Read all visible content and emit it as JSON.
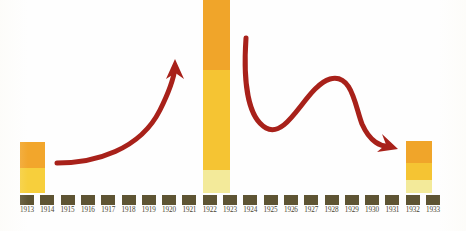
{
  "chart_data": {
    "type": "bar",
    "title": "",
    "subtitle": "",
    "xlabel": "",
    "ylabel": "",
    "grid": false,
    "legend_position": "none",
    "categories": [
      "1913",
      "1914",
      "1915",
      "1916",
      "1917",
      "1918",
      "1919",
      "1920",
      "1921",
      "1922",
      "1923",
      "1924",
      "1925",
      "1926",
      "1927",
      "1928",
      "1929",
      "1930",
      "1931",
      "1932",
      "1933"
    ],
    "annotations": [
      {
        "name": "rising-trend-arrow",
        "shape": "curved-arrow-up-right",
        "color": "#a8211a",
        "from_category": "1914",
        "to_category": "1921",
        "meaning": "sharp rise toward 1922 peak"
      },
      {
        "name": "falling-trend-arrow",
        "shape": "wavy-arrow-down-right",
        "color": "#a8211a",
        "from_category": "1923",
        "to_category": "1931",
        "meaning": "volatile decline toward 1932"
      }
    ],
    "series": [
      {
        "name": "top-segment",
        "color": "#f0a52a",
        "values": [
          26,
          0,
          0,
          0,
          0,
          0,
          0,
          0,
          0,
          70,
          0,
          0,
          0,
          0,
          0,
          0,
          0,
          0,
          0,
          22,
          0
        ]
      },
      {
        "name": "middle-segment",
        "color": "#f5c433",
        "values": [
          0,
          0,
          0,
          0,
          0,
          0,
          0,
          0,
          0,
          100,
          0,
          0,
          0,
          0,
          0,
          0,
          0,
          0,
          0,
          17,
          0
        ]
      },
      {
        "name": "bottom-segment",
        "color": "#f7d23f",
        "values": [
          25,
          0,
          0,
          0,
          0,
          0,
          0,
          0,
          0,
          0,
          0,
          0,
          0,
          0,
          0,
          0,
          0,
          0,
          0,
          0,
          0
        ]
      },
      {
        "name": "base-segment",
        "color": "#f3ea9a",
        "values": [
          0,
          0,
          0,
          0,
          0,
          0,
          0,
          0,
          0,
          23,
          0,
          0,
          0,
          0,
          0,
          0,
          0,
          0,
          0,
          13,
          0
        ]
      }
    ],
    "bars": [
      {
        "category": "1913",
        "x": 20,
        "width": 25,
        "top": 142,
        "bottom": 193,
        "clipped_top": false,
        "segments": [
          {
            "name": "orange-top",
            "color": "#f2a62c",
            "top": 142,
            "bottom": 168
          },
          {
            "name": "yellow-bottom",
            "color": "#f7cf3c",
            "top": 168,
            "bottom": 193
          }
        ]
      },
      {
        "category": "1922",
        "x": 203,
        "width": 27,
        "top": 0,
        "bottom": 193,
        "clipped_top": true,
        "segments": [
          {
            "name": "orange-top",
            "color": "#f0a52a",
            "top": 0,
            "bottom": 70
          },
          {
            "name": "amber-middle",
            "color": "#f5c433",
            "top": 70,
            "bottom": 170
          },
          {
            "name": "pale-yellow-base",
            "color": "#f3ea9a",
            "top": 170,
            "bottom": 193
          }
        ]
      },
      {
        "category": "1932",
        "x": 406,
        "width": 26,
        "top": 141,
        "bottom": 193,
        "clipped_top": false,
        "segments": [
          {
            "name": "orange-top",
            "color": "#f0a52a",
            "top": 141,
            "bottom": 163
          },
          {
            "name": "amber-middle",
            "color": "#f5c433",
            "top": 163,
            "bottom": 180
          },
          {
            "name": "pale-yellow-base",
            "color": "#f3ea9a",
            "top": 180,
            "bottom": 193
          }
        ]
      }
    ],
    "axis": {
      "tick_color": "#5e5433",
      "tick_width": 14,
      "tick_height": 10,
      "tick_top": 195,
      "first_tick_x": 20,
      "tick_pitch": 20.3,
      "label_top": 206,
      "label_color": "#4a4431"
    },
    "colors": {
      "background": "#ffffff",
      "arrow": "#a8211a",
      "bar_orange": "#f0a52a",
      "bar_amber": "#f5c433",
      "bar_yellow": "#f7cf3c",
      "bar_pale": "#f3ea9a",
      "tick": "#5e5433"
    }
  }
}
